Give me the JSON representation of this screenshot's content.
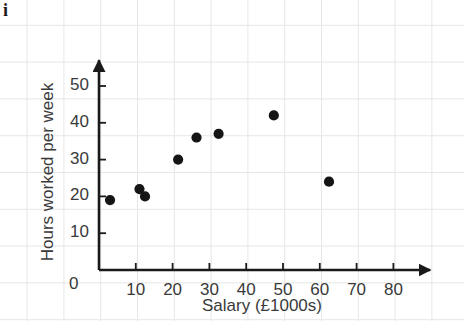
{
  "figure": {
    "part_label": "i",
    "colors": {
      "axis": "#1a1a1a",
      "point": "#151515",
      "grid": "#e6e6e6",
      "text": "#3a3a3a",
      "background": "#ffffff"
    }
  },
  "chart_data": {
    "type": "scatter",
    "title": "",
    "xlabel": "Salary (£1000s)",
    "ylabel": "Hours worked per week",
    "xlim": [
      0,
      90
    ],
    "ylim": [
      0,
      57
    ],
    "xticks": [
      10,
      20,
      30,
      40,
      50,
      60,
      70,
      80
    ],
    "xtick_labels": [
      "10",
      "20",
      "30",
      "40",
      "50",
      "60",
      "70",
      "80"
    ],
    "yticks": [
      10,
      20,
      30,
      40,
      50
    ],
    "ytick_labels": [
      "10",
      "20",
      "30",
      "40",
      "50"
    ],
    "origin_label": "0",
    "grid": true,
    "legend": null,
    "x": [
      3,
      11,
      12.5,
      21.5,
      26.5,
      32.5,
      47.5,
      62.5
    ],
    "y": [
      19,
      22,
      20,
      30,
      36,
      37,
      42,
      24
    ],
    "points": [
      {
        "x": 3,
        "y": 19
      },
      {
        "x": 11,
        "y": 22
      },
      {
        "x": 12.5,
        "y": 20
      },
      {
        "x": 21.5,
        "y": 30
      },
      {
        "x": 26.5,
        "y": 36
      },
      {
        "x": 32.5,
        "y": 37
      },
      {
        "x": 47.5,
        "y": 42
      },
      {
        "x": 62.5,
        "y": 24
      }
    ]
  }
}
